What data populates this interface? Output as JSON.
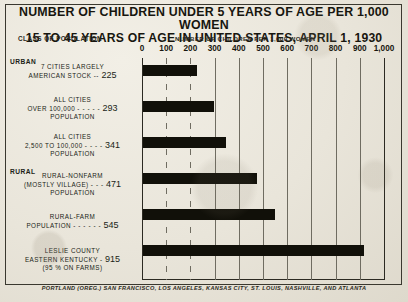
{
  "title": {
    "line1": "NUMBER OF CHILDREN UNDER 5 YEARS OF AGE PER 1,000 WOMEN",
    "line2": "15 TO 45 YEARS OF AGE IN UNITED STATES, APRIL 1, 1930"
  },
  "headers": {
    "class_of_population": "CLASS OF POPULATION",
    "number_of_children": "NUMBER OF CHILDREN PER 1,000 WOMEN"
  },
  "footer": "PORTLAND (OREG.) SAN FRANCISCO, LOS ANGELES, KANSAS CITY, ST. LOUIS, NASHVILLE, AND ATLANTA",
  "groups": [
    {
      "label": "URBAN"
    },
    {
      "label": "RURAL"
    }
  ],
  "rows": [
    {
      "lines": [
        "7 CITIES LARGELY",
        "AMERICAN STOCK"
      ],
      "leader": "--",
      "value": 225,
      "value_text": "225",
      "group": "URBAN"
    },
    {
      "lines": [
        "ALL CITIES",
        "OVER 100,000",
        "POPULATION"
      ],
      "leader": "- - - - -",
      "value": 293,
      "value_text": "293",
      "group": "URBAN"
    },
    {
      "lines": [
        "ALL CITIES",
        "2,500 TO 100,000",
        "POPULATION"
      ],
      "leader": "- - - -",
      "value": 341,
      "value_text": "341",
      "group": "URBAN"
    },
    {
      "lines": [
        "RURAL-NONFARM",
        "(MOSTLY VILLAGE)",
        "POPULATION"
      ],
      "leader": "- - -",
      "value": 471,
      "value_text": "471",
      "group": "RURAL"
    },
    {
      "lines": [
        "RURAL-FARM",
        "POPULATION"
      ],
      "leader": "- - - - - -",
      "value": 545,
      "value_text": "545",
      "group": "RURAL"
    },
    {
      "lines": [
        "LESLIE COUNTY",
        "EASTERN KENTUCKY",
        "(95 % ON FARMS)"
      ],
      "leader": "-",
      "value": 915,
      "value_text": "915",
      "group": "RURAL"
    }
  ],
  "axis": {
    "ticks": [
      "0",
      "100",
      "200",
      "300",
      "400",
      "500",
      "600",
      "700",
      "800",
      "900",
      "1,000"
    ],
    "min": 0,
    "max": 1000
  },
  "colors": {
    "paper": "#e9e5da",
    "ink": "#111009",
    "rule": "#2c2a22",
    "grid": "#6f6c61"
  },
  "chart_data": {
    "type": "bar",
    "orientation": "horizontal",
    "title": "NUMBER OF CHILDREN UNDER 5 YEARS OF AGE PER 1,000 WOMEN 15 TO 45 YEARS OF AGE IN UNITED STATES, APRIL 1, 1930",
    "xlabel": "NUMBER OF CHILDREN PER 1,000 WOMEN",
    "ylabel": "CLASS OF POPULATION",
    "categories": [
      "7 CITIES LARGELY AMERICAN STOCK",
      "ALL CITIES OVER 100,000 POPULATION",
      "ALL CITIES 2,500 TO 100,000 POPULATION",
      "RURAL-NONFARM (MOSTLY VILLAGE) POPULATION",
      "RURAL-FARM POPULATION",
      "LESLIE COUNTY EASTERN KENTUCKY (95 % ON FARMS)"
    ],
    "values": [
      225,
      293,
      341,
      471,
      545,
      915
    ],
    "xlim": [
      0,
      1000
    ],
    "xticks": [
      0,
      100,
      200,
      300,
      400,
      500,
      600,
      700,
      800,
      900,
      1000
    ],
    "grid": true,
    "legend": "none",
    "bar_color": "#111009"
  }
}
